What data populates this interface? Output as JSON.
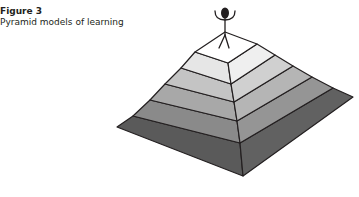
{
  "figure": {
    "number": "Figure 3",
    "title": "Pyramid models of learning"
  },
  "diagram": {
    "type": "stepped-pyramid",
    "layers": 6,
    "figure_on_top": "stick-figure-arms-raised",
    "layer_colors_left": [
      "#ffffff",
      "#e6e6e6",
      "#c2c2c2",
      "#a6a6a6",
      "#8a8a8a",
      "#5c5c5c"
    ],
    "layer_colors_right": [
      "#ffffff",
      "#eeeeee",
      "#cfcfcf",
      "#b3b3b3",
      "#939393",
      "#5f5f5f"
    ],
    "outline_color": "#231f20"
  }
}
